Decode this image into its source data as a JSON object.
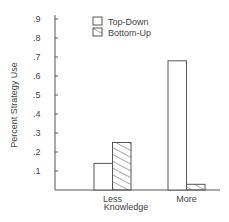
{
  "chart_data": {
    "type": "bar",
    "title": "",
    "xlabel": "Knowledge",
    "ylabel": "Percent Strategy Use",
    "categories": [
      "Less",
      "More"
    ],
    "series": [
      {
        "name": "Top-Down",
        "values": [
          0.14,
          0.68
        ],
        "pattern": "empty"
      },
      {
        "name": "Bottom-Up",
        "values": [
          0.25,
          0.03
        ],
        "pattern": "diagonal-hatch"
      }
    ],
    "ylim": [
      0,
      0.9
    ],
    "yticks": [
      ".1",
      ".2",
      ".3",
      ".4",
      ".5",
      ".6",
      ".7",
      ".8",
      ".9"
    ],
    "grid": false,
    "legend_position": "top-center"
  },
  "colors": {
    "axis": "#555555",
    "bar_stroke": "#555555",
    "background": "#ffffff"
  }
}
